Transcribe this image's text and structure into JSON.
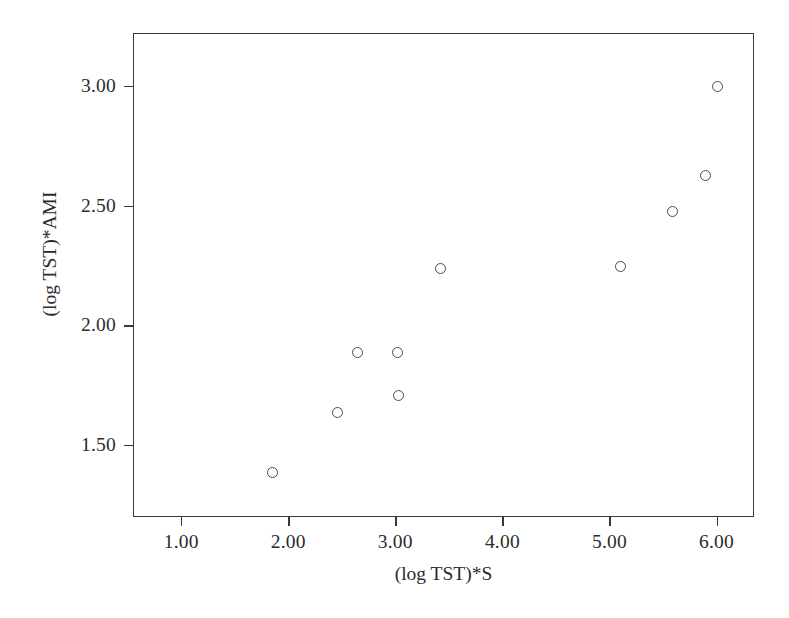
{
  "chart_data": {
    "type": "scatter",
    "title": "",
    "xlabel": "(log TST)*S",
    "ylabel": "(log TST)*AMI",
    "xlim": [
      0.55,
      6.35
    ],
    "ylim": [
      1.2,
      3.22
    ],
    "grid": false,
    "legend": null,
    "marker": "open-circle",
    "marker_color": "#4a4a4a",
    "xticks": [
      "1.00",
      "2.00",
      "3.00",
      "4.00",
      "5.00",
      "6.00"
    ],
    "xtick_values": [
      1.0,
      2.0,
      3.0,
      4.0,
      5.0,
      6.0
    ],
    "yticks": [
      "1.50",
      "2.00",
      "2.50",
      "3.00"
    ],
    "ytick_values": [
      1.5,
      2.0,
      2.5,
      3.0
    ],
    "points": [
      {
        "x": 1.84,
        "y": 1.39
      },
      {
        "x": 2.45,
        "y": 1.64
      },
      {
        "x": 2.64,
        "y": 1.89
      },
      {
        "x": 3.01,
        "y": 1.89
      },
      {
        "x": 3.02,
        "y": 1.71
      },
      {
        "x": 3.41,
        "y": 2.24
      },
      {
        "x": 5.09,
        "y": 2.25
      },
      {
        "x": 5.58,
        "y": 2.48
      },
      {
        "x": 5.89,
        "y": 2.63
      },
      {
        "x": 6.0,
        "y": 3.0
      }
    ]
  }
}
